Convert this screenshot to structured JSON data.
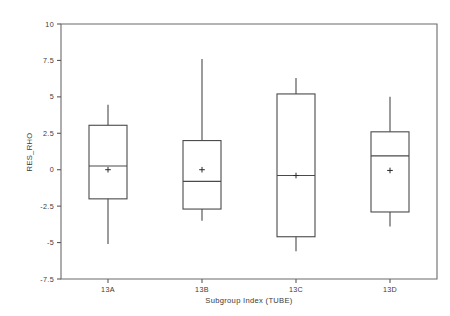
{
  "chart_data": {
    "type": "box",
    "title": "",
    "subtitle": "",
    "xlabel": "Subgroup Index (TUBE)",
    "ylabel": "RES_RHO",
    "categories": [
      "13A",
      "13B",
      "13C",
      "13D"
    ],
    "xtick_labels": [
      "13A",
      "13B",
      "13C",
      "13D"
    ],
    "ytick_labels": [
      "10",
      "7.5",
      "5",
      "2.5",
      "0",
      "-2.5",
      "-5",
      "-7.5"
    ],
    "ytick_values": [
      10,
      7.5,
      5,
      2.5,
      0,
      -2.5,
      -5,
      -7.5
    ],
    "ylim": [
      -7.5,
      10
    ],
    "grid": false,
    "legend": "none",
    "mean_marker": "+",
    "boxes": [
      {
        "category": "13A",
        "whisker_low": -5.1,
        "q1": -2.0,
        "median": 0.25,
        "mean": 0.0,
        "q3": 3.05,
        "whisker_high": 4.45
      },
      {
        "category": "13B",
        "whisker_low": -3.5,
        "q1": -2.7,
        "median": -0.8,
        "mean": 0.0,
        "q3": 2.0,
        "whisker_high": 7.6
      },
      {
        "category": "13C",
        "whisker_low": -5.6,
        "q1": -4.6,
        "median": -0.4,
        "mean": -0.4,
        "q3": 5.2,
        "whisker_high": 6.3
      },
      {
        "category": "13D",
        "whisker_low": -3.9,
        "q1": -2.9,
        "median": 0.95,
        "mean": -0.05,
        "q3": 2.6,
        "whisker_high": 5.0
      }
    ]
  },
  "axes": {
    "y_axis_title": "RES_RHO",
    "x_axis_title": "Subgroup Index (TUBE)"
  },
  "colors": {
    "background": "#ffffff",
    "line": "#4a4a4a",
    "axis": "#5a5a5a",
    "text": "#3a3a3a"
  }
}
